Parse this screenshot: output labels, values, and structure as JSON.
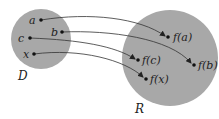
{
  "diagram": {
    "colors": {
      "set_fill": "#a8a8a8",
      "line": "#333333",
      "dot": "#111111",
      "background": "#ffffff"
    },
    "domain": {
      "label": "D",
      "cx": 41,
      "cy": 39,
      "r": 30,
      "label_x": 19,
      "label_y": 79
    },
    "range": {
      "label": "R",
      "cx": 170,
      "cy": 58,
      "r": 48,
      "label_x": 136,
      "label_y": 112
    },
    "inputs": [
      {
        "label": "a",
        "x": 41,
        "y": 20,
        "label_x": 30,
        "label_y": 24
      },
      {
        "label": "b",
        "x": 62,
        "y": 32,
        "label_x": 50,
        "label_y": 36
      },
      {
        "label": "c",
        "x": 30,
        "y": 38,
        "label_x": 18,
        "label_y": 42
      },
      {
        "label": "x",
        "x": 34,
        "y": 54,
        "label_x": 24,
        "label_y": 58
      }
    ],
    "outputs": [
      {
        "label": "f(a)",
        "x": 168,
        "y": 37,
        "label_x": 174,
        "label_y": 41
      },
      {
        "label": "f(b)",
        "x": 194,
        "y": 65,
        "label_x": 199,
        "label_y": 69
      },
      {
        "label": "f(c)",
        "x": 138,
        "y": 60,
        "label_x": 143,
        "label_y": 64
      },
      {
        "label": "f(x)",
        "x": 146,
        "y": 79,
        "label_x": 151,
        "label_y": 83
      }
    ],
    "arrows": [
      {
        "from": "a",
        "to": "f(a)"
      },
      {
        "from": "b",
        "to": "f(b)"
      },
      {
        "from": "c",
        "to": "f(c)"
      },
      {
        "from": "x",
        "to": "f(x)"
      }
    ]
  }
}
